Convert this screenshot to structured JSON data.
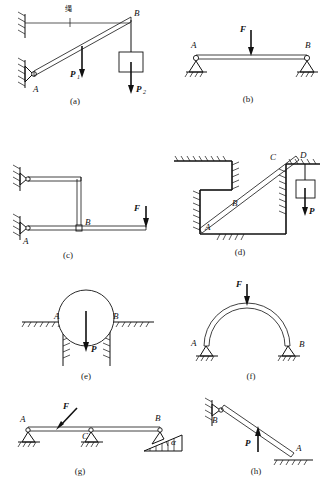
{
  "figure": {
    "panel_count": 8
  },
  "panels": [
    {
      "id": "a",
      "caption": "(a)",
      "description": "Inclined bar pinned at A to wall, tied by rope at B, carrying loads P1 and P2",
      "labels": {
        "rope": "绳",
        "point_a": "A",
        "point_b": "B",
        "force1": "P",
        "force1_sub": "1",
        "force2": "P",
        "force2_sub": "2"
      }
    },
    {
      "id": "b",
      "caption": "(b)",
      "description": "Simply supported beam, pin at A, roller at B, central load F",
      "labels": {
        "point_a": "A",
        "point_b": "B",
        "force": "F"
      }
    },
    {
      "id": "c",
      "caption": "(c)",
      "description": "Two horizontal bars joined by a vertical link at B, supported at left wall, load F at right end",
      "labels": {
        "point_a": "A",
        "point_b": "B",
        "force": "F"
      }
    },
    {
      "id": "d",
      "caption": "(d)",
      "description": "Inclined bar passing through a stepped opening, contacts at A, B, C, hanging weight P at D",
      "labels": {
        "point_a": "A",
        "point_b": "B",
        "point_c": "C",
        "point_d": "D",
        "force": "P"
      }
    },
    {
      "id": "e",
      "caption": "(e)",
      "description": "Cylinder resting between two vertical walls at contacts A and B with weight P",
      "labels": {
        "point_a": "A",
        "point_b": "B",
        "force": "P"
      }
    },
    {
      "id": "f",
      "caption": "(f)",
      "description": "Semi-circular arch with pin supports at A and B, vertical load F at crown",
      "labels": {
        "point_a": "A",
        "point_b": "B",
        "force": "F"
      }
    },
    {
      "id": "g",
      "caption": "(g)",
      "description": "Continuous beam on pin A, roller C, inclined roller B on plane at angle alpha, oblique load F",
      "labels": {
        "point_a": "A",
        "point_b": "B",
        "point_c": "C",
        "force": "F",
        "angle": "α"
      }
    },
    {
      "id": "h",
      "caption": "(h)",
      "description": "Inclined bar pinned at wall B resting on ground at A, load P",
      "labels": {
        "point_a": "A",
        "point_b": "B",
        "force": "P"
      }
    }
  ],
  "colors": {
    "ink": "#111111",
    "background": "#ffffff"
  }
}
